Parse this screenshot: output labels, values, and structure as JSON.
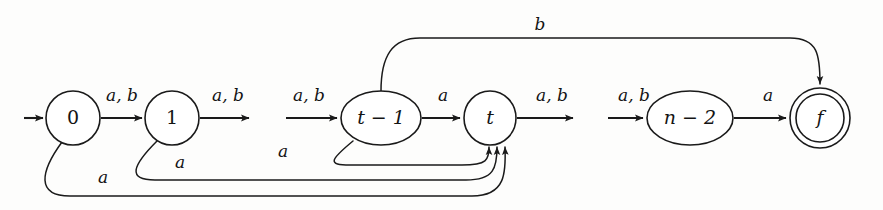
{
  "diagram": {
    "kind": "finite-automaton-state-diagram",
    "alphabet": [
      "a",
      "b"
    ],
    "canvas": {
      "width": 883,
      "height": 210
    },
    "background_color": "#fdfdfc",
    "stroke_color": "#1a1a1a",
    "states": [
      {
        "id": "q0",
        "label": "0",
        "shape": "circle",
        "accepting": false,
        "initial": true,
        "cx": 73,
        "cy": 118,
        "rx": 27,
        "ry": 27
      },
      {
        "id": "q1",
        "label": "1",
        "shape": "circle",
        "accepting": false,
        "initial": false,
        "cx": 172,
        "cy": 118,
        "rx": 27,
        "ry": 27
      },
      {
        "id": "qt1",
        "label": "t − 1",
        "shape": "ellipse",
        "accepting": false,
        "initial": false,
        "cx": 381,
        "cy": 118,
        "rx": 40,
        "ry": 27
      },
      {
        "id": "qt",
        "label": "t",
        "shape": "circle",
        "accepting": false,
        "initial": false,
        "cx": 490,
        "cy": 118,
        "rx": 26,
        "ry": 27
      },
      {
        "id": "qn2",
        "label": "n − 2",
        "shape": "ellipse",
        "accepting": false,
        "initial": false,
        "cx": 690,
        "cy": 118,
        "rx": 43,
        "ry": 27
      },
      {
        "id": "qf",
        "label": "f",
        "shape": "double-circle",
        "accepting": true,
        "initial": false,
        "cx": 820,
        "cy": 118,
        "rx": 30,
        "ry": 30,
        "inner_rx": 24,
        "inner_ry": 24
      }
    ],
    "transitions": [
      {
        "id": "t-start",
        "from": "",
        "to": "q0",
        "label": "",
        "style": "start-arrow"
      },
      {
        "id": "t-0-1",
        "from": "q0",
        "to": "q1",
        "label": "a, b",
        "style": "straight",
        "label_x": 122,
        "label_y": 96
      },
      {
        "id": "t-1-out",
        "from": "q1",
        "to": "",
        "label": "a, b",
        "style": "straight-dangling",
        "label_x": 228,
        "label_y": 96
      },
      {
        "id": "t-in-t1",
        "from": "",
        "to": "qt1",
        "label": "a, b",
        "style": "straight-incoming",
        "label_x": 309,
        "label_y": 96
      },
      {
        "id": "t-t1-t",
        "from": "qt1",
        "to": "qt",
        "label": "a",
        "style": "straight",
        "label_x": 443,
        "label_y": 96
      },
      {
        "id": "t-t-out",
        "from": "qt",
        "to": "",
        "label": "a, b",
        "style": "straight-dangling",
        "label_x": 552,
        "label_y": 96
      },
      {
        "id": "t-in-n2",
        "from": "",
        "to": "qn2",
        "label": "a, b",
        "style": "straight-incoming",
        "label_x": 634,
        "label_y": 96
      },
      {
        "id": "t-n2-f",
        "from": "qn2",
        "to": "qf",
        "label": "a",
        "style": "straight",
        "label_x": 768,
        "label_y": 96
      },
      {
        "id": "t-t1-f-b",
        "from": "qt1",
        "to": "qf",
        "label": "b",
        "style": "arc-top",
        "label_x": 540,
        "label_y": 25
      },
      {
        "id": "t-t1-t-a",
        "from": "qt1",
        "to": "qt",
        "label": "a",
        "style": "arc-bottom-1",
        "label_x": 283,
        "label_y": 152
      },
      {
        "id": "t-1-t-a",
        "from": "q1",
        "to": "qt",
        "label": "a",
        "style": "arc-bottom-2",
        "label_x": 180,
        "label_y": 163
      },
      {
        "id": "t-0-t-a",
        "from": "q0",
        "to": "qt",
        "label": "a",
        "style": "arc-bottom-3",
        "label_x": 103,
        "label_y": 178
      }
    ]
  }
}
